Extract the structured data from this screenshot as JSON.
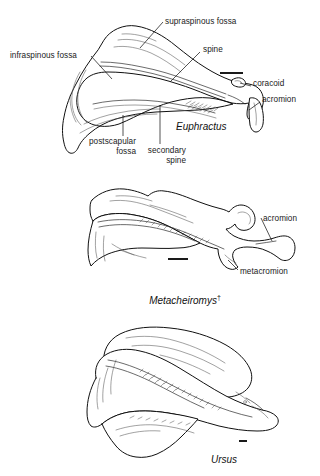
{
  "figure": {
    "background_color": "#ffffff",
    "ink_color": "#111111"
  },
  "panels": [
    {
      "id": "panel-euphractus",
      "taxon": "Euphractus",
      "extinct": false,
      "taxon_suffix": "",
      "scale_bar": {
        "label": "",
        "x": 220,
        "y": 72,
        "width": 23,
        "height": 2
      },
      "labels": [
        {
          "name": "supraspinous-fossa",
          "text": "supraspinous fossa",
          "x": 165,
          "y": 18,
          "align": "left"
        },
        {
          "name": "infraspinous-fossa",
          "text": "infraspinous fossa",
          "x": 10,
          "y": 52,
          "align": "left"
        },
        {
          "name": "spine",
          "text": "spine",
          "x": 203,
          "y": 46,
          "align": "left"
        },
        {
          "name": "coracoid",
          "text": "coracoid",
          "x": 253,
          "y": 84,
          "align": "left"
        },
        {
          "name": "acromion",
          "text": "acromion",
          "x": 262,
          "y": 100,
          "align": "left"
        },
        {
          "name": "postscapular-fossa",
          "text": "postscapular\nfossa",
          "x": 86,
          "y": 140,
          "align": "right"
        },
        {
          "name": "secondary-spine",
          "text": "secondary\nspine",
          "x": 146,
          "y": 148,
          "align": "right"
        }
      ]
    },
    {
      "id": "panel-metacheiromys",
      "taxon": "Metacheiromys",
      "extinct": true,
      "taxon_suffix": "†",
      "scale_bar": {
        "label": "",
        "x": 168,
        "y": 258,
        "width": 20,
        "height": 2
      },
      "labels": [
        {
          "name": "acromion",
          "text": "acromion",
          "x": 263,
          "y": 214,
          "align": "left"
        },
        {
          "name": "metacromion",
          "text": "metacromion",
          "x": 240,
          "y": 267,
          "align": "left"
        }
      ]
    },
    {
      "id": "panel-ursus",
      "taxon": "Ursus",
      "extinct": false,
      "taxon_suffix": "",
      "scale_bar": {
        "label": "",
        "x": 239,
        "y": 440,
        "width": 8,
        "height": 2
      },
      "labels": []
    }
  ],
  "taxon_positions": [
    {
      "name": "euphractus",
      "text": "Euphractus",
      "x": 176,
      "y": 121
    },
    {
      "name": "metacheiromys",
      "text": "Metacheiromys",
      "x": 138,
      "y": 283
    },
    {
      "name": "ursus",
      "text": "Ursus",
      "x": 211,
      "y": 454
    }
  ]
}
